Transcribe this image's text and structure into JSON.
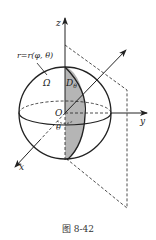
{
  "figure": {
    "caption": "图 8-42",
    "labels": {
      "z_axis": "z",
      "y_axis": "y",
      "x_axis": "x",
      "origin": "O",
      "angle": "θ",
      "region": "Ω",
      "section": "D",
      "section_sub": "θ",
      "surface": "r=r(φ, θ)"
    },
    "colors": {
      "stroke": "#222222",
      "shade": "#b5b5b5",
      "background": "#ffffff"
    }
  }
}
